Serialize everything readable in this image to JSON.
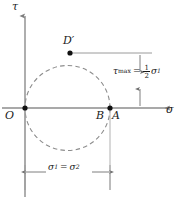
{
  "figure": {
    "background_color": "#ffffff",
    "line_color": "#8c8c8c",
    "text_color": "#1a1a1a",
    "point_color": "#000000",
    "width": 183,
    "height": 204
  },
  "axes": {
    "vertical": {
      "label": "τ",
      "name": "tau"
    },
    "horizontal": {
      "label": "σ",
      "name": "sigma"
    }
  },
  "points": [
    {
      "id": "O",
      "label": "O",
      "x": 25,
      "y": 108,
      "role": "origin"
    },
    {
      "id": "B",
      "label": "B",
      "x": 110,
      "y": 108,
      "role": "circle-right"
    },
    {
      "id": "A",
      "label": "A",
      "x": 110,
      "y": 108,
      "role": "circle-right"
    },
    {
      "id": "Dp",
      "label": "D′",
      "x": 70,
      "y": 53,
      "role": "circle-top"
    }
  ],
  "circle": {
    "center_x": 67.5,
    "center_y": 108,
    "radius": 42.5,
    "style": "dashed"
  },
  "dimensions": {
    "tau_max": {
      "symbol": "τ",
      "subscript": "max",
      "equals": "=",
      "fraction_numerator": "1",
      "fraction_denominator": "2",
      "value_symbol": "σ",
      "value_subscript": "1",
      "orientation": "vertical"
    },
    "sigma_span": {
      "symbol_1": "σ",
      "subscript_1": "1",
      "equals": "=",
      "symbol_2": "σ",
      "subscript_2": "2",
      "orientation": "horizontal"
    }
  }
}
